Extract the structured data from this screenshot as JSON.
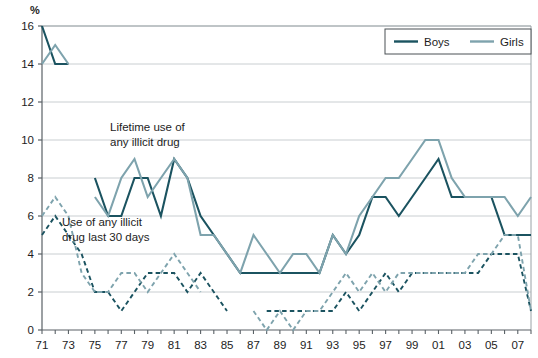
{
  "chart_data": {
    "type": "line",
    "title": "",
    "xlabel": "",
    "ylabel": "%",
    "ylim": [
      0,
      16
    ],
    "ytick_step": 2,
    "yticks": [
      "0",
      "2",
      "4",
      "6",
      "8",
      "10",
      "12",
      "14",
      "16"
    ],
    "grid": true,
    "legend_position": "top-right",
    "x": [
      "71",
      "72",
      "73",
      "74",
      "75",
      "76",
      "77",
      "78",
      "79",
      "80",
      "81",
      "82",
      "83",
      "84",
      "85",
      "86",
      "87",
      "88",
      "89",
      "90",
      "91",
      "92",
      "93",
      "94",
      "95",
      "96",
      "97",
      "98",
      "99",
      "00",
      "01",
      "02",
      "03",
      "04",
      "05",
      "06",
      "07",
      "08"
    ],
    "xtick_labels": [
      "71",
      "73",
      "75",
      "77",
      "79",
      "81",
      "83",
      "85",
      "87",
      "89",
      "91",
      "93",
      "95",
      "97",
      "99",
      "01",
      "03",
      "05",
      "07"
    ],
    "xtick_label_every": 2,
    "legend": [
      {
        "name": "Boys",
        "color": "#1b5360",
        "style": "solid"
      },
      {
        "name": "Girls",
        "color": "#7ea3ad",
        "style": "solid"
      }
    ],
    "annotations": [
      {
        "id": "lifetime",
        "text_lines": [
          "Lifetime use of",
          "any illicit drug"
        ],
        "x": 110,
        "y": 131
      },
      {
        "id": "last30",
        "text_lines": [
          "Use of any illicit",
          "drug last 30 days"
        ],
        "x": 62,
        "y": 226
      }
    ],
    "series": [
      {
        "name": "Boys",
        "measure": "Lifetime use of any illicit drug",
        "color": "#1b5360",
        "style": "solid",
        "values": [
          16,
          14,
          14,
          null,
          8,
          6,
          6,
          8,
          8,
          6,
          9,
          8,
          6,
          5,
          4,
          3,
          3,
          3,
          3,
          3,
          3,
          3,
          5,
          4,
          5,
          7,
          7,
          6,
          7,
          8,
          9,
          7,
          7,
          7,
          7,
          5,
          5,
          5
        ]
      },
      {
        "name": "Girls",
        "measure": "Lifetime use of any illicit drug",
        "color": "#7ea3ad",
        "style": "solid",
        "values": [
          14,
          15,
          14,
          null,
          7,
          6,
          8,
          9,
          7,
          8,
          9,
          8,
          5,
          5,
          4,
          3,
          5,
          4,
          3,
          4,
          4,
          3,
          5,
          4,
          6,
          7,
          8,
          8,
          9,
          10,
          10,
          8,
          7,
          7,
          7,
          7,
          6,
          7
        ]
      },
      {
        "name": "Boys",
        "measure": "Use of any illicit drug last 30 days",
        "color": "#1b5360",
        "style": "dashed",
        "values": [
          5,
          6,
          5,
          4,
          2,
          2,
          1,
          2,
          3,
          3,
          3,
          2,
          3,
          2,
          1,
          null,
          null,
          1,
          1,
          1,
          1,
          1,
          1,
          2,
          1,
          2,
          3,
          2,
          3,
          3,
          3,
          3,
          3,
          3,
          4,
          4,
          4,
          1
        ]
      },
      {
        "name": "Girls",
        "measure": "Use of any illicit drug last 30 days",
        "color": "#7ea3ad",
        "style": "dashed",
        "values": [
          6,
          7,
          6,
          3,
          2,
          2,
          3,
          3,
          2,
          3,
          4,
          3,
          2,
          null,
          null,
          null,
          1,
          0,
          1,
          0,
          1,
          1,
          2,
          3,
          2,
          3,
          2,
          3,
          3,
          3,
          3,
          3,
          3,
          4,
          4,
          5,
          5,
          1
        ]
      }
    ]
  },
  "colors": {
    "boys": "#1b5360",
    "girls": "#7ea3ad",
    "grid": "#c9ced1",
    "axis": "#5a6166",
    "plot_border": "#9aa2a6",
    "text": "#1d1d1d",
    "background": "#ffffff"
  }
}
